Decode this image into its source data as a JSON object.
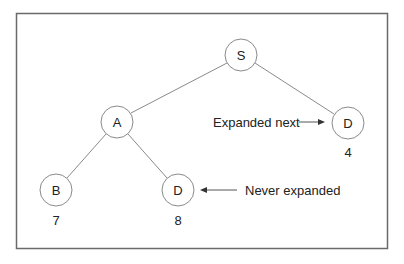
{
  "diagram": {
    "type": "search-tree",
    "nodes": [
      {
        "id": "S",
        "label": "S",
        "value": null
      },
      {
        "id": "A",
        "label": "A",
        "value": null
      },
      {
        "id": "D_right",
        "label": "D",
        "value": "4"
      },
      {
        "id": "B",
        "label": "B",
        "value": "7"
      },
      {
        "id": "D_bottom",
        "label": "D",
        "value": "8"
      }
    ],
    "edges": [
      {
        "from": "S",
        "to": "A"
      },
      {
        "from": "S",
        "to": "D_right"
      },
      {
        "from": "A",
        "to": "B"
      },
      {
        "from": "A",
        "to": "D_bottom"
      }
    ],
    "annotations": {
      "expanded_next": "Expanded next",
      "never_expanded": "Never expanded"
    }
  }
}
